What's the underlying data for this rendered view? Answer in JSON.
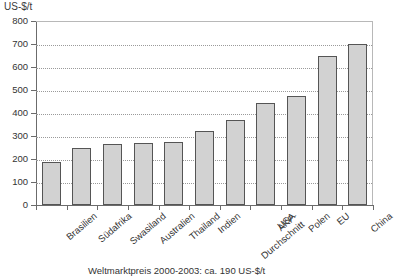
{
  "chart_data": {
    "type": "bar",
    "title": "",
    "subtitle": "",
    "xlabel": "",
    "ylabel": "US-$/t",
    "ylim": [
      0,
      800
    ],
    "ytick_step": 100,
    "yticks": [
      "800",
      "700",
      "600",
      "500",
      "400",
      "300",
      "200",
      "100",
      "0"
    ],
    "grid": true,
    "legend": null,
    "categories": [
      "Brasilien",
      "Südafrika",
      "Swasiland",
      "Australien",
      "Thailand",
      "Indien",
      "AKP-\nDurchschnitt",
      "USA",
      "Polen",
      "EU",
      "China"
    ],
    "values": [
      185,
      250,
      265,
      270,
      275,
      320,
      370,
      445,
      475,
      650,
      700
    ],
    "annotation": "Weltmarktpreis 2000-2003: ca. 190 US-$/t",
    "bar_fill": "#d2d2d2",
    "bar_border": "#555555",
    "grid_color": "#9a9a9a",
    "axis_color": "#6b6b6b"
  },
  "axis": {
    "unit_label": "US-$/t"
  },
  "caption": {
    "text": "Weltmarktpreis 2000-2003: ca. 190 US-$/t"
  }
}
